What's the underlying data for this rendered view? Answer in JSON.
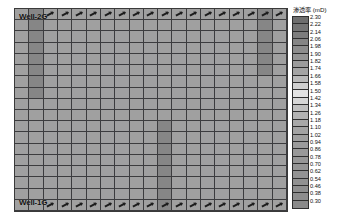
{
  "figure": {
    "background_color": "#ffffff",
    "panel_border_color": "#3a3a3a"
  },
  "annotations": {
    "well_top_label": "Well-2G",
    "well_bottom_label": "Well-1G",
    "perforation_icon": "arrow-icon"
  },
  "legend": {
    "title": "渗透率 (mD)",
    "position": "right",
    "orientation": "vertical",
    "tick_labels": [
      "2.30",
      "2.22",
      "2.14",
      "2.06",
      "1.98",
      "1.90",
      "1.82",
      "1.74",
      "1.66",
      "1.58",
      "1.50",
      "1.42",
      "1.34",
      "1.26",
      "1.18",
      "1.10",
      "1.02",
      "0.94",
      "0.86",
      "0.78",
      "0.70",
      "0.62",
      "0.54",
      "0.46",
      "0.38",
      "0.30"
    ],
    "swatch_colors": [
      "#6e6e6e",
      "#757575",
      "#7d7d7d",
      "#858585",
      "#8d8d8d",
      "#949494",
      "#9c9c9c",
      "#a4a4a4",
      "#b9b9b9",
      "#cfcfcf",
      "#e3e3e3",
      "#d6d6d6",
      "#bfbfbf",
      "#b2b2b2",
      "#a8a8a8",
      "#a3a3a3",
      "#9f9f9f",
      "#9b9b9b",
      "#999999",
      "#979797",
      "#959595",
      "#939393",
      "#919191",
      "#8f8f8f",
      "#8d8d8d",
      "#8a8a8a"
    ]
  },
  "chart_data": {
    "type": "heatmap",
    "title": "",
    "xlabel": "",
    "ylabel": "",
    "cbar_label": "渗透率 (mD)",
    "grid": true,
    "n_cols": 19,
    "n_rows": 18,
    "vmin": 0.3,
    "vmax": 2.3,
    "tick_step": 0.08,
    "colormap": "grayscale",
    "base_value": 1.1,
    "base_color": "#a0a0a0",
    "anomalies": [
      {
        "name": "left-low-perm-column",
        "col": 1,
        "row_start": 0,
        "row_end": 7,
        "value": 0.62,
        "color": "#868686"
      },
      {
        "name": "center-low-perm-column",
        "col": 10,
        "row_start": 10,
        "row_end": 17,
        "value": 0.62,
        "color": "#868686"
      },
      {
        "name": "right-low-perm-column",
        "col": 17,
        "row_start": 0,
        "row_end": 5,
        "value": 0.62,
        "color": "#868686"
      }
    ],
    "perforation_rows": [
      0,
      17
    ],
    "perforation_cols_top": [
      2,
      3,
      4,
      5,
      6,
      7,
      8,
      9,
      10,
      11,
      12,
      13,
      14,
      15,
      16,
      17,
      18
    ],
    "perforation_cols_bottom": [
      2,
      3,
      4,
      5,
      6,
      7,
      8,
      9,
      10,
      11,
      12,
      13,
      14,
      15,
      16,
      17,
      18
    ]
  }
}
